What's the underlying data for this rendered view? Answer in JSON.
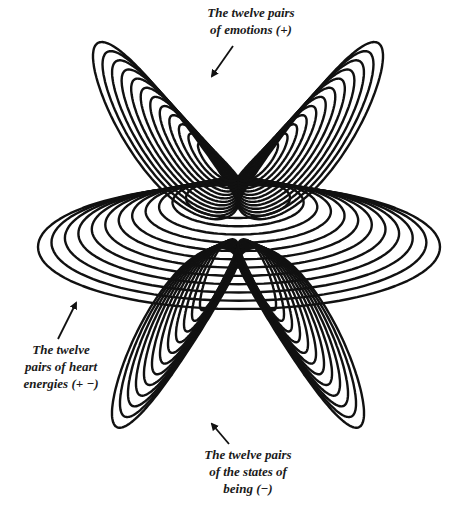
{
  "figure": {
    "ink_color": "#111111",
    "background": "#ffffff"
  },
  "labels": {
    "top": {
      "line1": "The twelve pairs",
      "line2": "of emotions  (+)"
    },
    "left": {
      "line1": "The twelve",
      "line2": "pairs of heart",
      "line3": "energies  (+ −)"
    },
    "bottom": {
      "line1": "The twelve pairs",
      "line2": "of the states of",
      "line3": "being  (−)"
    }
  },
  "families": {
    "emotions": {
      "count": 12,
      "sign": "+",
      "position": "top",
      "shape": "upward double-lobe (heart)"
    },
    "heart_energies": {
      "count": 12,
      "sign": "+ −",
      "position": "middle",
      "shape": "horizontal ellipses"
    },
    "states_of_being": {
      "count": 12,
      "sign": "−",
      "position": "bottom",
      "shape": "downward double-lobe"
    }
  },
  "arrows": [
    {
      "name": "arrow-to-emotions",
      "x1": 233,
      "y1": 46,
      "x2": 212,
      "y2": 76
    },
    {
      "name": "arrow-to-heart-energies",
      "x1": 58,
      "y1": 339,
      "x2": 76,
      "y2": 303
    },
    {
      "name": "arrow-to-states-of-being",
      "x1": 229,
      "y1": 444,
      "x2": 212,
      "y2": 424
    }
  ]
}
